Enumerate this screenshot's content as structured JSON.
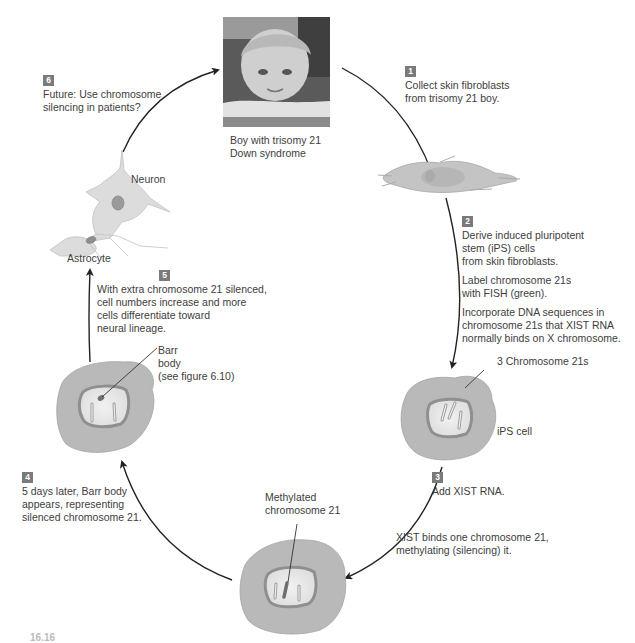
{
  "figure": {
    "colors": {
      "cytoplasm": "#b9b9b9",
      "nucleus_rim": "#8f8f8f",
      "nucleoplasm": "#e6e6e6",
      "badge": "#7a7a7a",
      "text": "#3d3d3d",
      "arrow": "#222222"
    },
    "photo": {
      "caption_lines": [
        "Boy with trisomy 21",
        "Down syndrome"
      ]
    },
    "steps": [
      {
        "number": "1",
        "paragraphs": [
          [
            "Collect skin fibroblasts",
            "from trisomy 21 boy."
          ]
        ]
      },
      {
        "number": "2",
        "paragraphs": [
          [
            "Derive induced pluripotent",
            "stem (iPS) cells",
            "from skin fibroblasts."
          ],
          [
            "Label chromosome 21s",
            "with FISH (green)."
          ],
          [
            "Incorporate DNA sequences in",
            "chromosome 21s that XIST RNA",
            "normally binds on X chromosome."
          ]
        ]
      },
      {
        "number": "3",
        "paragraphs": [
          [
            "Add XIST RNA."
          ],
          [
            "XIST binds one chromosome 21,",
            "methylating (silencing) it."
          ]
        ]
      },
      {
        "number": "4",
        "paragraphs": [
          [
            "5 days later, Barr body",
            "appears, representing",
            "silenced chromosome 21."
          ]
        ]
      },
      {
        "number": "5",
        "paragraphs": [
          [
            "With extra chromosome 21 silenced,",
            "cell numbers increase and more",
            "cells differentiate toward",
            "neural lineage."
          ]
        ]
      },
      {
        "number": "6",
        "paragraphs": [
          [
            "Future: Use chromosome",
            "silencing in patients?"
          ]
        ]
      }
    ],
    "labels": {
      "three_chromosomes": "3 Chromosome 21s",
      "ips_cell": "iPS cell",
      "methylated": [
        "Methylated",
        "chromosome 21"
      ],
      "barr_body": [
        "Barr",
        "body",
        "(see figure 6.10)"
      ],
      "neuron": "Neuron",
      "astrocyte": "Astrocyte"
    },
    "figure_number": "16.16"
  }
}
